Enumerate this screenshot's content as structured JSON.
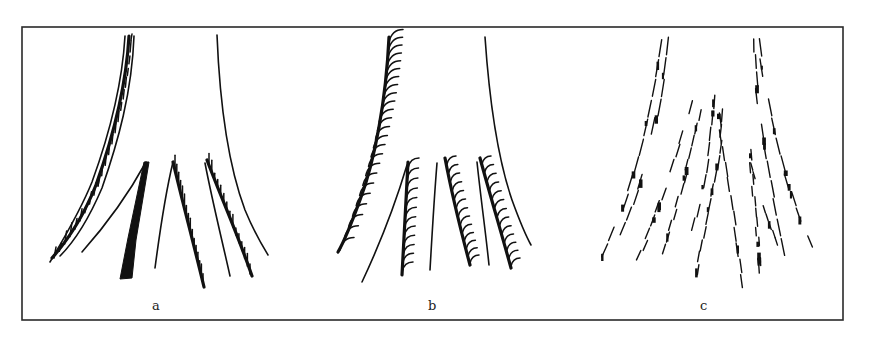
{
  "figure": {
    "panels": [
      {
        "id": "a",
        "label": "a",
        "style": "dense-stippled-strokes"
      },
      {
        "id": "b",
        "label": "b",
        "style": "curved-hatching"
      },
      {
        "id": "c",
        "label": "c",
        "style": "scribbled-strokes"
      }
    ],
    "colors": {
      "ink": "#111111",
      "frame": "#2a2a2a",
      "background": "#ffffff"
    }
  }
}
